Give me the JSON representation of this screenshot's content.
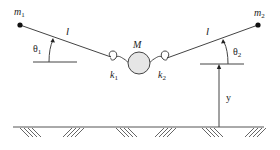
{
  "diagram": {
    "type": "mechanical-schematic",
    "labels": {
      "m1": "m",
      "m1_sub": "1",
      "m2": "m",
      "m2_sub": "2",
      "M": "M",
      "l_left": "l",
      "l_right": "l",
      "theta1": "θ",
      "theta1_sub": "1",
      "theta2": "θ",
      "theta2_sub": "2",
      "k1": "k",
      "k1_sub": "1",
      "k2": "k",
      "k2_sub": "2",
      "y": "y"
    },
    "colors": {
      "line": "#444444",
      "mass_fill": "#e6e6e6",
      "dot": "#111111"
    }
  }
}
